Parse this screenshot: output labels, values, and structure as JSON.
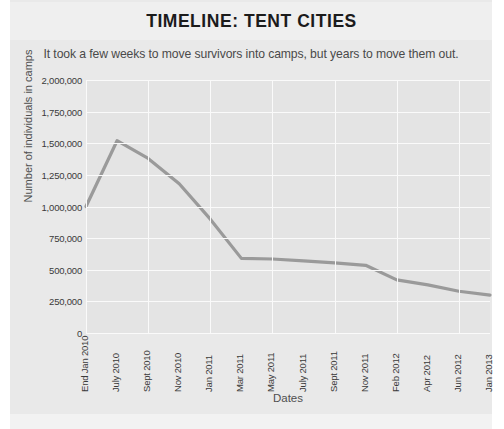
{
  "header": {
    "title": "TIMELINE: TENT CITIES",
    "subtitle": "It took a few weeks to move survivors into camps, but years to move them out."
  },
  "colors": {
    "card_background": "#e9e9e9",
    "plot_background": "#e4e4e4",
    "gridline": "#fafafa",
    "line": "#9a9a9a",
    "title_text": "#1b1b1b",
    "axis_text": "#3a3a3a"
  },
  "chart_data": {
    "type": "line",
    "title": "TIMELINE: TENT CITIES",
    "subtitle": "It took a few weeks to move survivors into camps, but years to move them out.",
    "xlabel": "Dates",
    "ylabel": "Number of individuals in camps",
    "categories": [
      "End Jan 2010",
      "July 2010",
      "Sept 2010",
      "Nov 2010",
      "Jan 2011",
      "Mar 2011",
      "May 2011",
      "July 2011",
      "Sept 2011",
      "Nov 2011",
      "Feb 2012",
      "Apr 2012",
      "Jun 2012",
      "Jan 2013"
    ],
    "values": [
      1000000,
      1520000,
      1380000,
      1180000,
      900000,
      590000,
      585000,
      570000,
      555000,
      535000,
      420000,
      380000,
      330000,
      300000
    ],
    "ylim": [
      0,
      2000000
    ],
    "yticks": [
      0,
      250000,
      500000,
      750000,
      1000000,
      1250000,
      1500000,
      1750000,
      2000000
    ],
    "ytick_labels": [
      "0",
      "250,000",
      "500,000",
      "750,000",
      "1,000,000",
      "1,250,000",
      "1,500,000",
      "1,750,000",
      "2,000,000"
    ],
    "grid": true,
    "legend": false,
    "series": [
      {
        "name": "Individuals in camps",
        "values": [
          1000000,
          1520000,
          1380000,
          1180000,
          900000,
          590000,
          585000,
          570000,
          555000,
          535000,
          420000,
          380000,
          330000,
          300000
        ]
      }
    ]
  }
}
